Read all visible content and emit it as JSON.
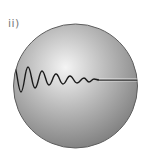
{
  "label": "ii)",
  "diagram": {
    "type": "sphere-with-damped-wave",
    "sphere": {
      "cx": 75.5,
      "cy": 86,
      "r": 62,
      "highlight": "#f2f2f2",
      "base": "#9a9a9a",
      "edge": "#6e6e6e"
    },
    "wave": {
      "description": "damped oscillation decaying left to right, then flat line",
      "color": "#1a1a1a",
      "flat_line_color": "#ffffff"
    }
  }
}
